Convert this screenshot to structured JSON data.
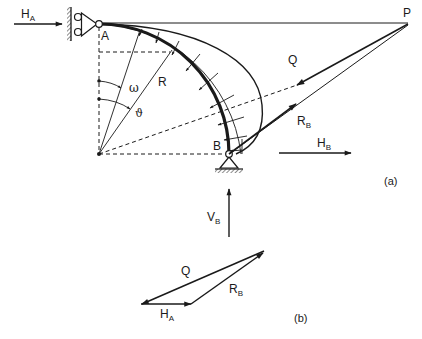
{
  "diagram": {
    "part_a": {
      "caption": "(a)",
      "points": {
        "A": "A",
        "B": "B",
        "P": "P"
      },
      "forces": {
        "H_A": {
          "main": "H",
          "sub": "A"
        },
        "H_B": {
          "main": "H",
          "sub": "B"
        },
        "V_B": {
          "main": "V",
          "sub": "B"
        },
        "R_B": {
          "main": "R",
          "sub": "B"
        },
        "Q": {
          "main": "Q"
        }
      },
      "geometry_labels": {
        "radius": "R",
        "angle_omega": "ω",
        "angle_theta": "ϑ"
      }
    },
    "part_b": {
      "caption": "(b)",
      "forces": {
        "Q": {
          "main": "Q"
        },
        "R_B": {
          "main": "R",
          "sub": "B"
        },
        "H_A": {
          "main": "H",
          "sub": "A"
        }
      }
    },
    "colors": {
      "ink": "#1a1a1a",
      "background": "#ffffff"
    }
  }
}
